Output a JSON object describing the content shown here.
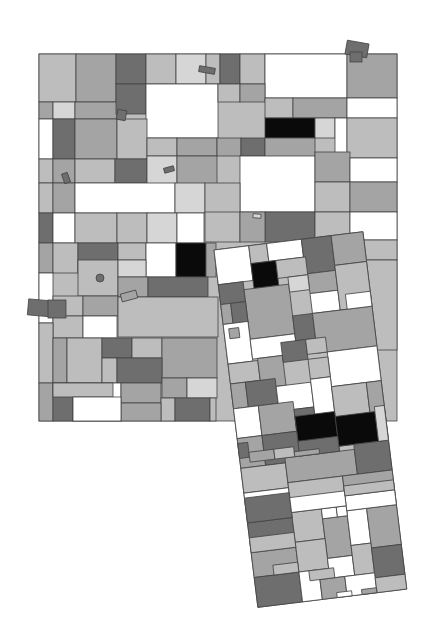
{
  "artwork": {
    "title": "",
    "palette": {
      "white": "#ffffff",
      "pale": "#d6d6d6",
      "light": "#bdbdbd",
      "mid": "#a4a4a4",
      "dark": "#6e6e6e",
      "black": "#0a0a0a",
      "outline": "#444444"
    },
    "main_grid_tones": [
      "light",
      "mid",
      "dark",
      "light",
      "pale",
      "light",
      "dark",
      "light",
      "white",
      "mid",
      "mid",
      "pale",
      "mid",
      "dark",
      "white",
      "light",
      "mid",
      "light",
      "mid",
      "white",
      "white",
      "dark",
      "mid",
      "light",
      "light",
      "mid",
      "black",
      "pale",
      "white",
      "light",
      "light",
      "mid",
      "light",
      "dark",
      "pale",
      "mid",
      "mid",
      "dark",
      "mid",
      "white",
      "light",
      "mid",
      "white",
      "pale",
      "light",
      "mid",
      "white",
      "light",
      "mid",
      "dark",
      "dark",
      "white",
      "light",
      "light",
      "pale",
      "white",
      "light",
      "mid",
      "light",
      "white",
      "mid",
      "light",
      "dark",
      "light",
      "white",
      "black",
      "mid",
      "light",
      "mid",
      "light",
      "light",
      "pale",
      "mid",
      "dark",
      "white",
      "light",
      "mid",
      "light",
      "light",
      "white",
      "light",
      "mid",
      "light",
      "dark",
      "light",
      "mid",
      "light",
      "dark",
      "mid",
      "pale",
      "mid",
      "dark",
      "white",
      "mid",
      "light",
      "dark",
      "mid",
      "light",
      "light",
      "white"
    ],
    "rotated_panel_tones": [
      "white",
      "light",
      "white",
      "dark",
      "mid",
      "black",
      "light",
      "mid",
      "dark",
      "mid",
      "pale",
      "white",
      "light",
      "mid",
      "dark",
      "white",
      "white",
      "dark",
      "mid",
      "light",
      "mid",
      "dark",
      "light",
      "white",
      "mid",
      "dark",
      "white",
      "light",
      "white",
      "mid",
      "dark",
      "white",
      "light",
      "mid",
      "black",
      "black",
      "mid",
      "dark",
      "light",
      "mid",
      "dark",
      "white",
      "light",
      "mid",
      "dark",
      "light",
      "mid",
      "white",
      "mid",
      "white",
      "white",
      "white",
      "mid",
      "light",
      "white",
      "light",
      "dark",
      "dark",
      "white",
      "mid",
      "white",
      "light",
      "dark",
      "white",
      "light",
      "light",
      "pale",
      "white",
      "mid",
      "dark",
      "light",
      "light",
      "white",
      "mid",
      "dark",
      "mid",
      "light",
      "mid",
      "dark",
      "light"
    ],
    "scattered_chip_tones": [
      "dark",
      "dark",
      "dark",
      "dark",
      "dark",
      "mid",
      "dark",
      "pale"
    ]
  }
}
